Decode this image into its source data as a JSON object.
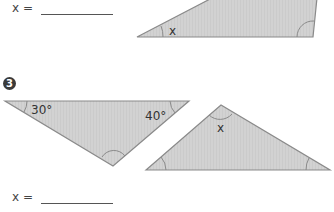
{
  "exercise_2": {
    "answer_label": "x =",
    "angle_labels": {
      "unknown": "x"
    }
  },
  "exercise_3": {
    "number": "3",
    "answer_label": "x =",
    "triangle_a": {
      "angle_1": "30°",
      "angle_2": "40°"
    },
    "triangle_b": {
      "unknown": "x"
    }
  },
  "colors": {
    "fill": "#cfcfcf",
    "stroke": "#8a8a8a",
    "badge": "#3a3a3a"
  }
}
